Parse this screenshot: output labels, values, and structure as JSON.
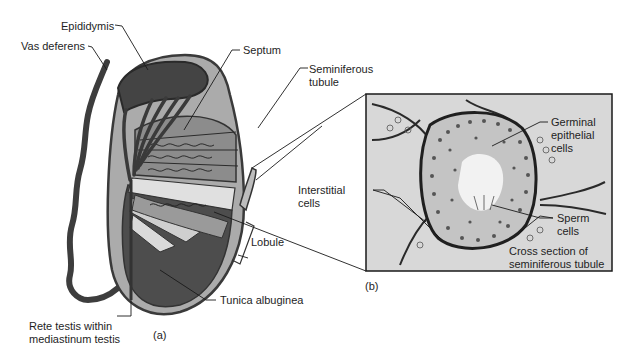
{
  "figure": {
    "panel_a": {
      "caption": "(a)",
      "labels": {
        "epididymis": "Epididymis",
        "vas_deferens": "Vas deferens",
        "septum": "Septum",
        "seminiferous_tubule_line1": "Seminiferous",
        "seminiferous_tubule_line2": "tubule",
        "lobule": "Lobule",
        "tunica_albuginea": "Tunica albuginea",
        "rete_testis_line1": "Rete testis within",
        "rete_testis_line2": "mediastinum testis"
      }
    },
    "panel_b": {
      "caption": "(b)",
      "labels": {
        "germinal_line1": "Germinal",
        "germinal_line2": "epithelial",
        "germinal_line3": "cells",
        "interstitial_line1": "Interstitial",
        "interstitial_line2": "cells",
        "sperm_line1": "Sperm",
        "sperm_line2": "cells",
        "cross_section_line1": "Cross section of",
        "cross_section_line2": "seminiferous tubule"
      }
    },
    "colors": {
      "outline": "#3a3a3a",
      "tunica": "#a9a9a9",
      "dark_tissue": "#4a4a4a",
      "light_tissue": "#d6d6d6",
      "panel_bg": "#d9d9d9",
      "line": "#1a1a1a"
    }
  }
}
